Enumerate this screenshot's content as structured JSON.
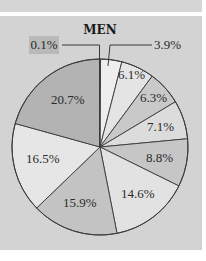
{
  "chart_data": {
    "type": "pie",
    "title": "MEN",
    "categories": [
      "0.1%",
      "3.9%",
      "6.1%",
      "6.3%",
      "7.1%",
      "8.8%",
      "14.6%",
      "15.9%",
      "16.5%",
      "20.7%"
    ],
    "values": [
      0.1,
      3.9,
      6.1,
      6.3,
      7.1,
      8.8,
      14.6,
      15.9,
      16.5,
      20.7
    ],
    "start_angle": "12 o'clock",
    "direction": "clockwise",
    "colors": [
      "#bdbdbd",
      "#eeeeee",
      "#e4e4e4",
      "#c9c9c9",
      "#dcdcdc",
      "#c6c6c6",
      "#e2e2e2",
      "#c3c3c3",
      "#e6e6e6",
      "#b3b3b3"
    ],
    "legend": "none",
    "data_labels": true
  },
  "labels": {
    "title": "MEN",
    "slice_labels": [
      "0.1%",
      "3.9%",
      "6.1%",
      "6.3%",
      "7.1%",
      "8.8%",
      "14.6%",
      "15.9%",
      "16.5%",
      "20.7%"
    ]
  },
  "colors": {
    "background": "#d3d3d3",
    "outline": "#3a3a3a",
    "callout_box": "#b9b9b9"
  }
}
